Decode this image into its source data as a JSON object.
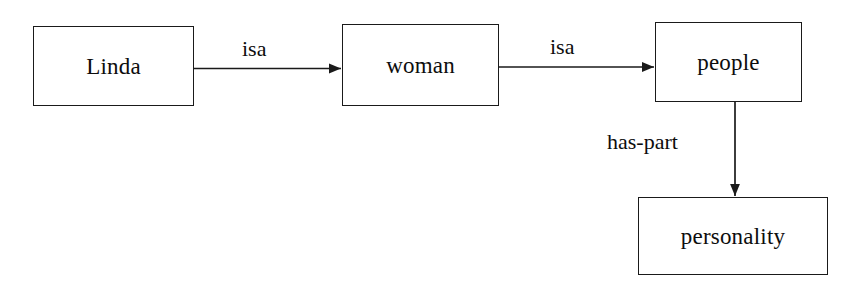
{
  "diagram": {
    "type": "semantic-network",
    "nodes": [
      {
        "id": "linda",
        "label": "Linda"
      },
      {
        "id": "woman",
        "label": "woman"
      },
      {
        "id": "people",
        "label": "people"
      },
      {
        "id": "personality",
        "label": "personality"
      }
    ],
    "edges": [
      {
        "id": "edge-linda-woman",
        "label": "isa",
        "from": "linda",
        "to": "woman",
        "direction": "right"
      },
      {
        "id": "edge-woman-people",
        "label": "isa",
        "from": "woman",
        "to": "people",
        "direction": "right"
      },
      {
        "id": "edge-people-personality",
        "label": "has-part",
        "from": "people",
        "to": "personality",
        "direction": "down"
      }
    ],
    "colors": {
      "background": "#ffffff",
      "stroke": "#1a1a1a",
      "text": "#0d0d0d"
    }
  }
}
